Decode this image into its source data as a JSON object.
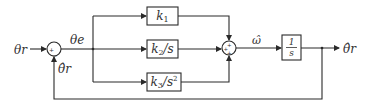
{
  "diagram": {
    "type": "control-block-diagram",
    "signals": {
      "input": "θr",
      "error": "θe",
      "feedback": "θ̂r",
      "omega": "ω̂",
      "output": "θ̂r"
    },
    "blocks": {
      "k1": "k1",
      "k2": "k2/s",
      "k3": "k3/s²",
      "integrator_num": "1",
      "integrator_den": "s"
    },
    "sum1_signs": {
      "left": "+",
      "bottom": "−"
    },
    "sum2_signs": {
      "top": "+",
      "left": "+",
      "bottom": "+"
    }
  }
}
